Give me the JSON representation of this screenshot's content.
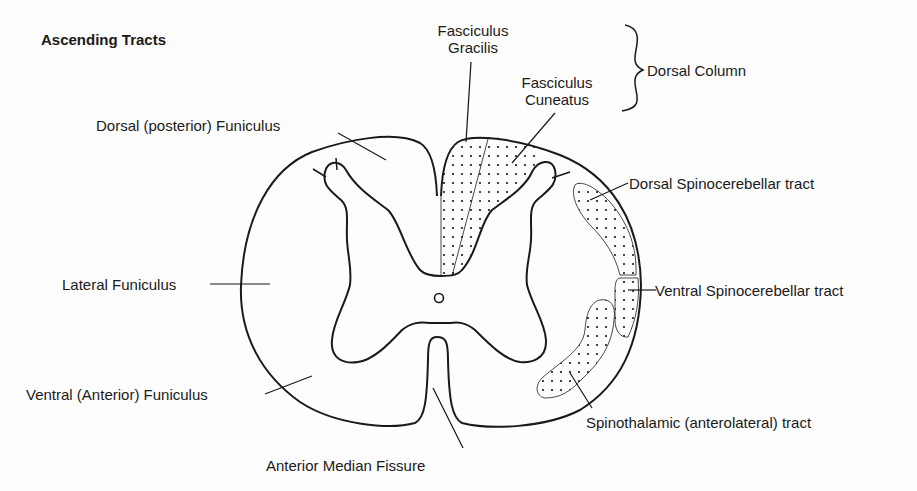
{
  "title": "Ascending Tracts",
  "labels": {
    "fasciculus_gracilis": [
      "Fasciculus",
      "Gracilis"
    ],
    "fasciculus_cuneatus": [
      "Fasciculus",
      "Cuneatus"
    ],
    "dorsal_column": "Dorsal Column",
    "dorsal_funiculus": "Dorsal (posterior) Funiculus",
    "dorsal_spinocerebellar": "Dorsal Spinocerebellar tract",
    "lateral_funiculus": "Lateral Funiculus",
    "ventral_spinocerebellar": "Ventral Spinocerebellar tract",
    "ventral_funiculus": "Ventral (Anterior) Funiculus",
    "spinothalamic": "Spinothalamic (anterolateral) tract",
    "anterior_median_fissure": "Anterior Median Fissure"
  },
  "colors": {
    "ink": "#1a1a1a",
    "background": "#fdfdfd"
  }
}
